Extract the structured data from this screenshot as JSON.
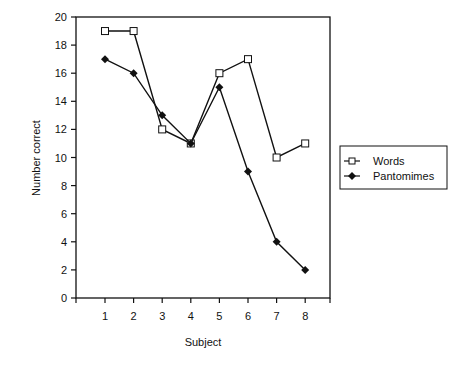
{
  "chart_data": {
    "type": "line",
    "title": "",
    "xlabel": "Subject",
    "ylabel": "Number correct",
    "categories": [
      "1",
      "2",
      "3",
      "4",
      "5",
      "6",
      "7",
      "8"
    ],
    "x": [
      1,
      2,
      3,
      4,
      5,
      6,
      7,
      8
    ],
    "series": [
      {
        "name": "Words",
        "marker": "open-square",
        "values": [
          19,
          19,
          12,
          11,
          16,
          17,
          10,
          11
        ]
      },
      {
        "name": "Pantomimes",
        "marker": "filled-diamond",
        "values": [
          17,
          16,
          13,
          11,
          15,
          9,
          4,
          2
        ]
      }
    ],
    "ylim": [
      0,
      20
    ],
    "yticks": [
      0,
      2,
      4,
      6,
      8,
      10,
      12,
      14,
      16,
      18,
      20
    ],
    "grid": false,
    "legend_position": "right"
  },
  "legend": {
    "items": [
      {
        "label": "Words"
      },
      {
        "label": "Pantomimes"
      }
    ]
  }
}
